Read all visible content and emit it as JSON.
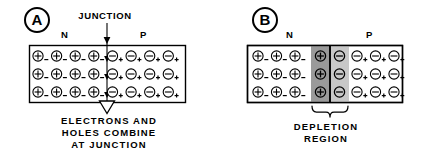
{
  "figure": {
    "background_color": "#ffffff",
    "line_color": "#000000"
  },
  "panels": [
    {
      "badge": "A",
      "junction_label": "JUNCTION",
      "n_label": "N",
      "p_label": "P",
      "caption_lines": [
        "ELECTRONS AND",
        "HOLES COMBINE",
        "AT JUNCTION"
      ],
      "n_side": {
        "symbol": "plus-circle",
        "glyph": "+",
        "subscript": "-",
        "columns": 4,
        "rows": 3
      },
      "p_side": {
        "symbol": "minus-circle",
        "glyph": "-",
        "subscript": "+",
        "columns": 4,
        "rows": 3
      },
      "junction_arrows": 4,
      "has_depletion_region": false
    },
    {
      "badge": "B",
      "n_label": "N",
      "p_label": "P",
      "caption_lines": [
        "DEPLETION",
        "REGION"
      ],
      "n_side": {
        "symbol": "plus-circle",
        "glyph": "+",
        "subscript": "-",
        "columns": 3,
        "rows": 3
      },
      "p_side": {
        "symbol": "minus-circle",
        "glyph": "-",
        "subscript": "+",
        "columns": 3,
        "rows": 3
      },
      "depletion": {
        "n_band_color": "#9a9a9a",
        "p_band_color": "#c8c8c8",
        "n_band_symbol": "plus-circle",
        "n_band_glyph": "+",
        "p_band_symbol": "minus-circle",
        "p_band_glyph": "-",
        "columns_each_side": 1,
        "rows": 3,
        "brace": "curly-brace-down"
      },
      "has_depletion_region": true
    }
  ],
  "colors": {
    "stroke": "#000000",
    "fill_white": "#ffffff",
    "depletion_dark": "#9a9a9a",
    "depletion_light": "#c8c8c8"
  }
}
